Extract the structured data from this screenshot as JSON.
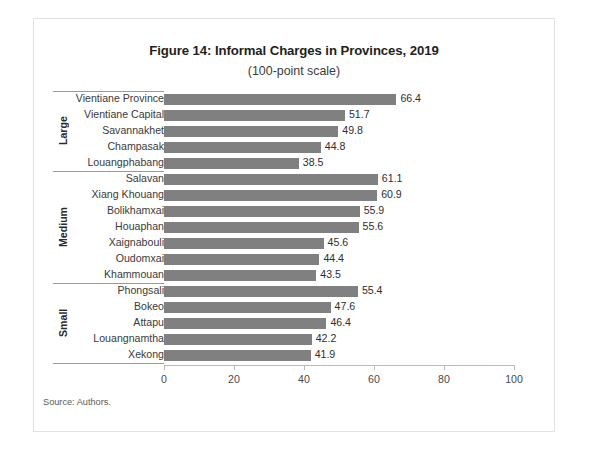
{
  "figure": {
    "title": "Figure 14: Informal Charges in Provinces, 2019",
    "subtitle": "(100-point scale)",
    "source": "Source: Authors."
  },
  "chart_data": {
    "type": "bar",
    "orientation": "horizontal",
    "title": "Figure 14: Informal Charges in Provinces, 2019",
    "subtitle": "(100-point scale)",
    "xlabel": "",
    "ylabel": "",
    "xlim": [
      0,
      100
    ],
    "xticks": [
      0,
      20,
      40,
      60,
      80,
      100
    ],
    "xtick_labels": [
      "0",
      "20",
      "40",
      "60",
      "80",
      "100"
    ],
    "grid": false,
    "legend": false,
    "bar_color": "#808080",
    "categories": [
      "Vientiane Province",
      "Vientiane Capital",
      "Savannakhet",
      "Champasak",
      "Louangphabang",
      "Salavan",
      "Xiang Khouang",
      "Bolikhamxai",
      "Houaphan",
      "Xaignabouli",
      "Oudomxai",
      "Khammouan",
      "Phongsali",
      "Bokeo",
      "Attapu",
      "Louangnamtha",
      "Xekong"
    ],
    "values": [
      66.4,
      51.7,
      49.8,
      44.8,
      38.5,
      61.1,
      60.9,
      55.9,
      55.6,
      45.6,
      44.4,
      43.5,
      55.4,
      47.6,
      46.4,
      42.2,
      41.9
    ],
    "groups": [
      {
        "name": "Large",
        "items": [
          {
            "label": "Vientiane Province",
            "value": 66.4,
            "value_text": "66.4"
          },
          {
            "label": "Vientiane Capital",
            "value": 51.7,
            "value_text": "51.7"
          },
          {
            "label": "Savannakhet",
            "value": 49.8,
            "value_text": "49.8"
          },
          {
            "label": "Champasak",
            "value": 44.8,
            "value_text": "44.8"
          },
          {
            "label": "Louangphabang",
            "value": 38.5,
            "value_text": "38.5"
          }
        ]
      },
      {
        "name": "Medium",
        "items": [
          {
            "label": "Salavan",
            "value": 61.1,
            "value_text": "61.1"
          },
          {
            "label": "Xiang Khouang",
            "value": 60.9,
            "value_text": "60.9"
          },
          {
            "label": "Bolikhamxai",
            "value": 55.9,
            "value_text": "55.9"
          },
          {
            "label": "Houaphan",
            "value": 55.6,
            "value_text": "55.6"
          },
          {
            "label": "Xaignabouli",
            "value": 45.6,
            "value_text": "45.6"
          },
          {
            "label": "Oudomxai",
            "value": 44.4,
            "value_text": "44.4"
          },
          {
            "label": "Khammouan",
            "value": 43.5,
            "value_text": "43.5"
          }
        ]
      },
      {
        "name": "Small",
        "items": [
          {
            "label": "Phongsali",
            "value": 55.4,
            "value_text": "55.4"
          },
          {
            "label": "Bokeo",
            "value": 47.6,
            "value_text": "47.6"
          },
          {
            "label": "Attapu",
            "value": 46.4,
            "value_text": "46.4"
          },
          {
            "label": "Louangnamtha",
            "value": 42.2,
            "value_text": "42.2"
          },
          {
            "label": "Xekong",
            "value": 41.9,
            "value_text": "41.9"
          }
        ]
      }
    ]
  }
}
